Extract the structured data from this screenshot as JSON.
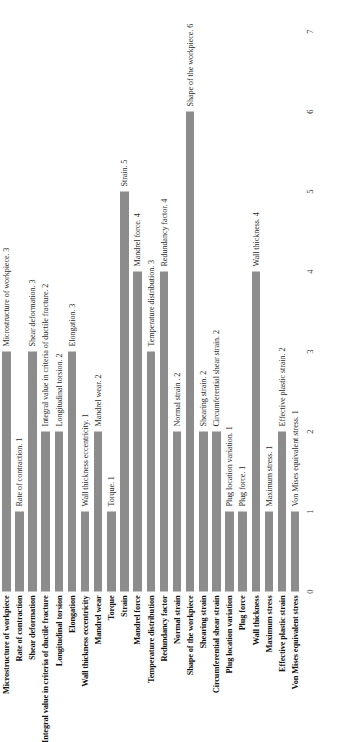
{
  "chart_data": {
    "type": "bar",
    "orientation": "horizontal",
    "title": "",
    "subtitle": "",
    "xlabel": "",
    "ylabel": "",
    "xlim": [
      0,
      7
    ],
    "xticks": [
      "0",
      "1",
      "2",
      "3",
      "4",
      "5",
      "6",
      "7"
    ],
    "grid": false,
    "legend": "none",
    "bar_color": "#8c8c8c",
    "categories": [
      "Microstructure of workpiece",
      "Rate of contraction",
      "Shear deformation",
      "Integral value in criteria of ductile fracture",
      "Longitudinal torsion",
      "Elongation",
      "Wall thickness eccentricity",
      "Mandrel wear",
      "Torque",
      "Strain",
      "Mandrel force",
      "Temperature distribution",
      "Redundancy factor",
      "Normal strain",
      "Shape of the workpiece",
      "Shearing strain",
      "Circumferential shear strain",
      "Plug location variation",
      "Plug force",
      "Wall thickness",
      "Maximum stress",
      "Effective plastic strain",
      "Von Mises equivalent stress"
    ],
    "values": [
      3,
      1,
      3,
      2,
      2,
      3,
      1,
      2,
      1,
      5,
      4,
      3,
      4,
      2,
      6,
      2,
      2,
      1,
      1,
      4,
      1,
      2,
      1
    ],
    "data_labels": [
      "Microstructure of workpiece. 3",
      "Rate of contraction. 1",
      "Shear deformation. 3",
      "Integral value in criteria of ductile fracture. 2",
      "Longitudinal torsion. 2",
      "Elongation. 3",
      "Wall thickness eccentricity. 1",
      "Mandrel wear. 2",
      "Torque. 1",
      "Strain. 5",
      "Mandrel force. 4",
      "Temperature distribution. 3",
      "Redundancy factor. 4",
      "Normal strain . 2",
      "Shape of the workpiece. 6",
      "Shearing strain. 2",
      "Circumferential shear strain. 2",
      "Plug location variation. 1",
      "Plug force. 1",
      "Wall thickness. 4",
      "Maximum stress. 1",
      "Effective plastic strain. 2",
      "Von Mises equivalent stress. 1"
    ]
  }
}
